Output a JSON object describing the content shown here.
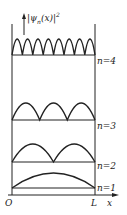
{
  "diagram": {
    "y_axis_label": "|ψ_n(x)|²",
    "y_axis_label_display": "|ψ",
    "y_axis_sub": "n",
    "y_axis_tail": "(x)|",
    "y_axis_sup": "2",
    "origin_label": "O",
    "L_label": "L",
    "x_axis_label": "x",
    "levels": [
      {
        "label": "n=4",
        "n": 4
      },
      {
        "label": "n=3",
        "n": 3
      },
      {
        "label": "n=2",
        "n": 2
      },
      {
        "label": "n=1",
        "n": 1
      }
    ],
    "colors": {
      "line": "#222222",
      "background": "#ffffff"
    }
  }
}
